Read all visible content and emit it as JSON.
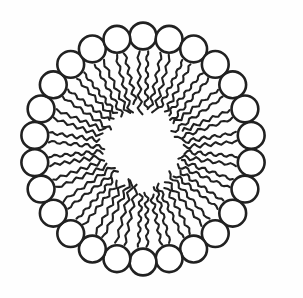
{
  "page": {
    "width": 303,
    "height": 298,
    "background": "#fefefe"
  },
  "diagram": {
    "kind": "micelle-cross-section",
    "colors": {
      "line": "#212121",
      "head_fill": "#ffffff",
      "background": "#fefefe"
    },
    "lipids": {
      "count": 26,
      "tails_per_lipid": 2,
      "head_shape": "circle",
      "tail_style": "wavy"
    },
    "geometry": {
      "width": 303,
      "height": 298,
      "center_x": 143,
      "center_y": 149,
      "ring_radius_x": 109,
      "ring_radius_y": 113,
      "ring_radius_nominal": 111,
      "start_angle_deg": -90,
      "head_radius": 13.4,
      "head_stroke_width": 2.6,
      "tail_stroke_width": 2.1,
      "tail_start_radius": 96,
      "tail_end_radius_min": 33,
      "tail_end_radius_max": 46,
      "tail_gap": 4.4,
      "tail_converge": 0.35,
      "tail_wave_amp_base": 1.1,
      "tail_wave_amp_grow": 1.3,
      "tail_wave_cycles": 5,
      "core_radius": 31
    }
  }
}
